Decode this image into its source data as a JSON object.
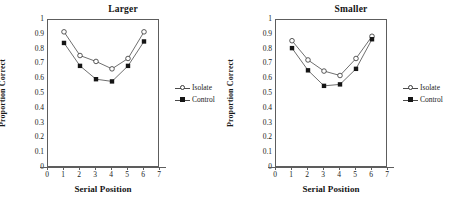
{
  "figure": {
    "panel_count": 2,
    "background": "#ffffff"
  },
  "chart_data": [
    {
      "type": "line",
      "title": "Larger",
      "xlabel": "Serial Position",
      "ylabel": "Proportion Correct",
      "x": [
        1,
        2,
        3,
        4,
        5,
        6
      ],
      "xlim": [
        0,
        7
      ],
      "ylim": [
        0,
        1
      ],
      "xticks": [
        0,
        1,
        2,
        3,
        4,
        5,
        6,
        7
      ],
      "yticks": [
        0,
        0.1,
        0.2,
        0.3,
        0.4,
        0.5,
        0.6,
        0.7,
        0.8,
        0.9,
        1
      ],
      "grid": false,
      "legend_position": "right",
      "series": [
        {
          "name": "Isolate",
          "marker": "open-circle",
          "color": "#303030",
          "values": [
            0.92,
            0.76,
            0.72,
            0.67,
            0.74,
            0.92
          ]
        },
        {
          "name": "Control",
          "marker": "filled-square",
          "color": "#151515",
          "values": [
            0.845,
            0.69,
            0.6,
            0.585,
            0.69,
            0.855
          ]
        }
      ]
    },
    {
      "type": "line",
      "title": "Smaller",
      "xlabel": "Serial Position",
      "ylabel": "Proportion Correct",
      "x": [
        1,
        2,
        3,
        4,
        5,
        6
      ],
      "xlim": [
        0,
        7
      ],
      "ylim": [
        0,
        1
      ],
      "xticks": [
        0,
        1,
        2,
        3,
        4,
        5,
        6,
        7
      ],
      "yticks": [
        0,
        0.1,
        0.2,
        0.3,
        0.4,
        0.5,
        0.6,
        0.7,
        0.8,
        0.9,
        1
      ],
      "grid": false,
      "legend_position": "right",
      "series": [
        {
          "name": "Isolate",
          "marker": "open-circle",
          "color": "#303030",
          "values": [
            0.86,
            0.73,
            0.655,
            0.625,
            0.74,
            0.89
          ]
        },
        {
          "name": "Control",
          "marker": "filled-square",
          "color": "#151515",
          "values": [
            0.81,
            0.66,
            0.555,
            0.565,
            0.67,
            0.87
          ]
        }
      ]
    }
  ],
  "axis_text": {
    "yticks": [
      "1",
      "0.9",
      "0.8",
      "0.7",
      "0.6",
      "0.5",
      "0.4",
      "0.3",
      "0.2",
      "0.1",
      "0"
    ],
    "xticks": [
      "0",
      "1",
      "2",
      "3",
      "4",
      "5",
      "6",
      "7"
    ]
  }
}
